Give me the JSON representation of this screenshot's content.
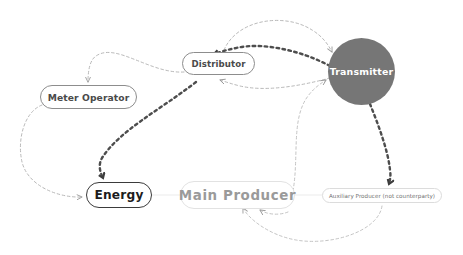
{
  "diagram": {
    "background_color": "#ffffff",
    "nodes": [
      {
        "id": "meter-operator",
        "label": "Meter Operator",
        "shape": "rounded-rectangle",
        "style": "outline-mid",
        "border_color": "#8d8d8d",
        "text_color": "#4a4a4a"
      },
      {
        "id": "distributor",
        "label": "Distributor",
        "shape": "rounded-rectangle",
        "style": "outline-mid",
        "border_color": "#8d8d8d",
        "text_color": "#4a4a4a"
      },
      {
        "id": "transmitter",
        "label": "Transmitter",
        "shape": "circle",
        "style": "filled",
        "fill_color": "#767676",
        "text_color": "#ffffff"
      },
      {
        "id": "energy",
        "label": "Energy",
        "shape": "rounded-rectangle",
        "style": "outline-strong",
        "border_color": "#3b3b3b",
        "text_color": "#1c1c1c"
      },
      {
        "id": "main-producer",
        "label": "Main Producer",
        "shape": "rounded-rectangle",
        "style": "outline-faint",
        "border_color": "#e2e2e2",
        "text_color": "#9a9a9a"
      },
      {
        "id": "auxiliary-producer",
        "label": "Auxiliary Producer (not counterparty)",
        "shape": "rounded-rectangle",
        "style": "outline-tiny",
        "border_color": "#dcdcdc",
        "text_color": "#6f6f6f"
      }
    ],
    "edges": [
      {
        "id": "distributor-to-meter-operator",
        "from": "distributor",
        "to": "meter-operator",
        "style": "dashed-light",
        "color": "#b9b9b9",
        "arrow": true
      },
      {
        "id": "meter-operator-to-energy",
        "from": "meter-operator",
        "to": "energy",
        "style": "dashed-light",
        "color": "#b9b9b9",
        "arrow": true
      },
      {
        "id": "distributor-to-energy",
        "from": "distributor",
        "to": "energy",
        "style": "dashed-bold",
        "color": "#4d4d4d",
        "arrow": true
      },
      {
        "id": "distributor-to-transmitter-upper",
        "from": "distributor",
        "to": "transmitter",
        "style": "dashed-light",
        "color": "#b9b9b9",
        "arrow": true
      },
      {
        "id": "transmitter-to-distributor",
        "from": "transmitter",
        "to": "distributor",
        "style": "dashed-bold",
        "color": "#4d4d4d",
        "arrow": true
      },
      {
        "id": "transmitter-to-distributor-lower",
        "from": "transmitter",
        "to": "distributor",
        "style": "dashed-light",
        "color": "#b9b9b9",
        "arrow": true
      },
      {
        "id": "main-producer-to-transmitter",
        "from": "main-producer",
        "to": "transmitter",
        "style": "dashed-light",
        "color": "#c4c4c4",
        "arrow": true
      },
      {
        "id": "transmitter-to-auxiliary-producer",
        "from": "transmitter",
        "to": "auxiliary-producer",
        "style": "dashed-bold",
        "color": "#4d4d4d",
        "arrow": true
      },
      {
        "id": "auxiliary-producer-to-main-producer",
        "from": "auxiliary-producer",
        "to": "main-producer",
        "style": "dashed-light",
        "color": "#c4c4c4",
        "arrow": true
      },
      {
        "id": "energy-to-main-producer",
        "from": "energy",
        "to": "main-producer",
        "style": "solid-faint",
        "color": "#ededed",
        "arrow": false
      },
      {
        "id": "main-producer-to-auxiliary-producer",
        "from": "main-producer",
        "to": "auxiliary-producer",
        "style": "solid-faint",
        "color": "#ededed",
        "arrow": false
      }
    ]
  }
}
